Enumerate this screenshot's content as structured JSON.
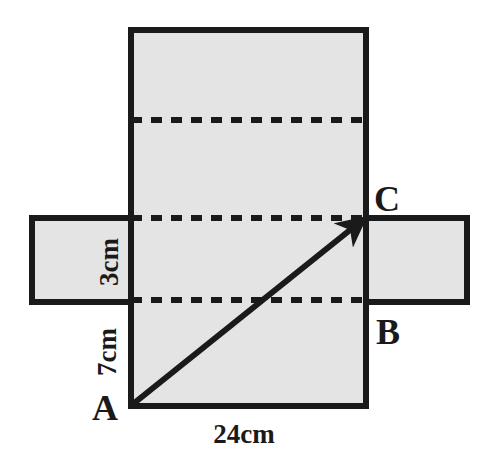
{
  "figure": {
    "background_color": "#ffffff",
    "face_fill_color": "#e4e4e4",
    "stroke_color": "#1a1a1a",
    "dashed_color": "#1a1a1a"
  },
  "labels": {
    "vertex_a": "A",
    "vertex_b": "B",
    "vertex_c": "C",
    "dim_bottom": "24cm",
    "dim_left_height": "7cm",
    "dim_depth": "3cm"
  },
  "chart_data": {
    "type": "diagram",
    "faces": [
      {
        "name": "center-face",
        "x": 131,
        "y": 30,
        "width": 235,
        "height": 376
      },
      {
        "name": "left-face",
        "x": 32,
        "y": 218,
        "width": 99,
        "height": 84
      },
      {
        "name": "right-face",
        "x": 366,
        "y": 218,
        "width": 101,
        "height": 84
      }
    ],
    "fold_lines": [
      {
        "name": "upper-fold",
        "orientation": "horizontal",
        "x1": 131,
        "y1": 120,
        "x2": 366,
        "y2": 120
      },
      {
        "name": "top-of-band-fold",
        "orientation": "horizontal",
        "x1": 131,
        "y1": 218,
        "x2": 366,
        "y2": 218
      },
      {
        "name": "bottom-of-band-fold",
        "orientation": "horizontal",
        "x1": 131,
        "y1": 300,
        "x2": 366,
        "y2": 300
      },
      {
        "name": "left-vertical-fold",
        "orientation": "vertical",
        "x1": 131,
        "y1": 218,
        "x2": 131,
        "y2": 302
      },
      {
        "name": "right-vertical-fold",
        "orientation": "vertical",
        "x1": 366,
        "y1": 218,
        "x2": 366,
        "y2": 302
      }
    ],
    "path_arrow": {
      "name": "diagonal-a-to-c",
      "from": {
        "label": "A",
        "x": 132,
        "y": 406
      },
      "to": {
        "label": "C",
        "x": 366,
        "y": 218
      }
    },
    "dimensions": [
      {
        "label": "24cm",
        "value": 24,
        "unit": "cm",
        "edge": "bottom-width"
      },
      {
        "label": "7cm",
        "value": 7,
        "unit": "cm",
        "edge": "left-lower-height"
      },
      {
        "label": "3cm",
        "value": 3,
        "unit": "cm",
        "edge": "band-depth"
      }
    ]
  }
}
